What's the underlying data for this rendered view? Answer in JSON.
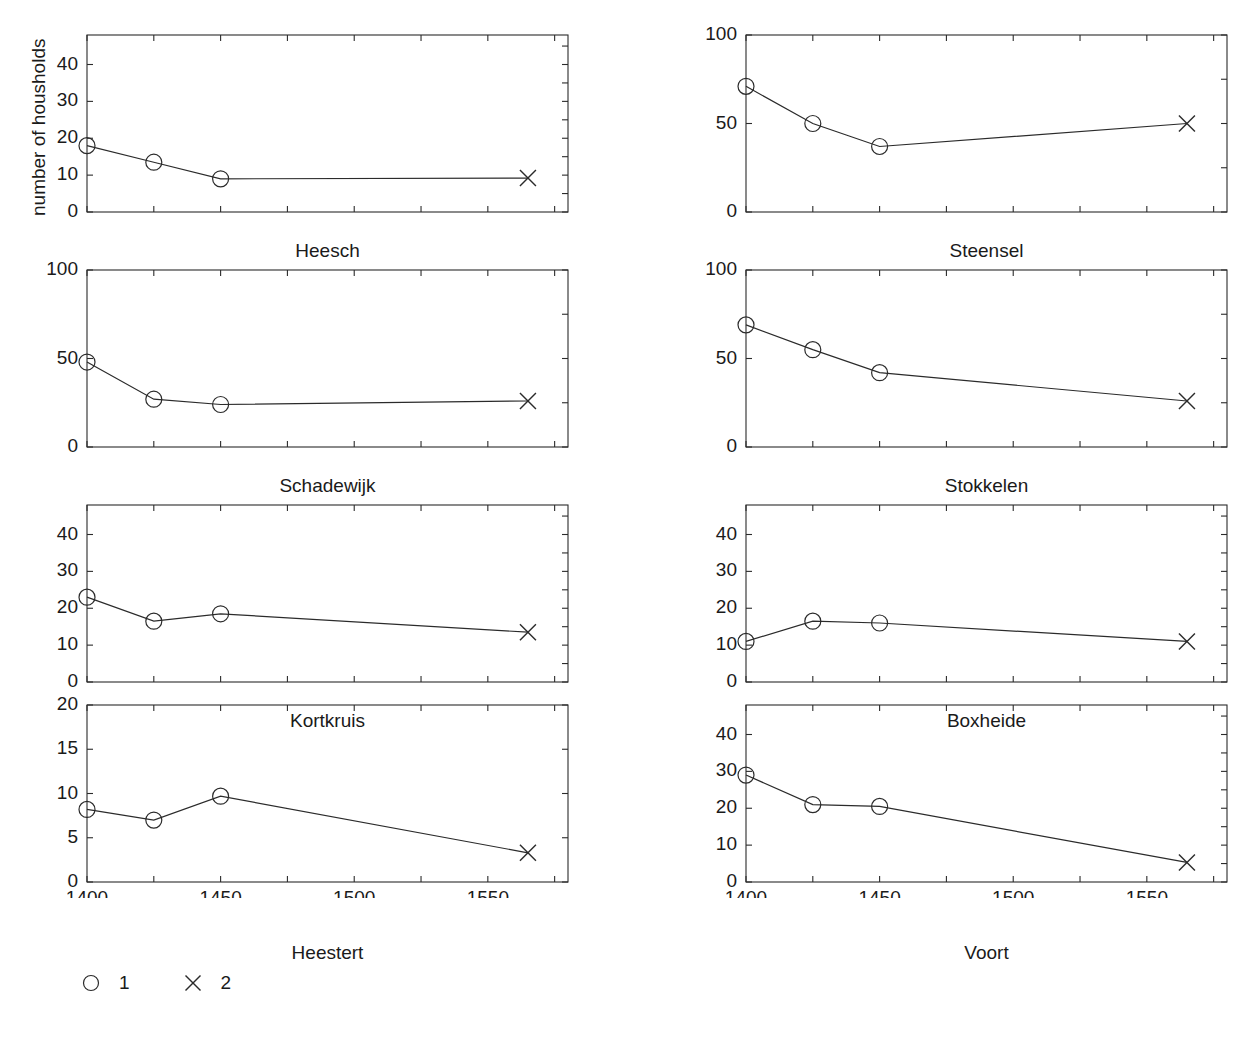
{
  "figure": {
    "ylabel": "number of housholds",
    "xtick_labels": [
      "1400",
      "1450",
      "1500",
      "1550"
    ],
    "xtick_values": [
      1400,
      1450,
      1500,
      1550
    ],
    "legend": [
      {
        "marker": "circle",
        "label": "1"
      },
      {
        "marker": "x",
        "label": "2"
      }
    ]
  },
  "chart_data": {
    "type": "line",
    "title": "",
    "xlabel": "",
    "ylabel": "number of housholds",
    "xlim": [
      1400,
      1580
    ],
    "x": [
      1400,
      1425,
      1450,
      1565
    ],
    "grid": false,
    "legend_position": "bottom-left",
    "legend_entries": [
      "1",
      "2"
    ],
    "marker_by_x": [
      "circle",
      "circle",
      "circle",
      "x"
    ],
    "panels": [
      {
        "name": "Heesch",
        "row": 0,
        "col": 0,
        "ylim": [
          0,
          48
        ],
        "yticks": [
          0,
          10,
          20,
          30,
          40
        ],
        "ytick_labels": [
          "0",
          "10",
          "20",
          "30",
          "40"
        ],
        "values": [
          18,
          13.5,
          9,
          9.2
        ]
      },
      {
        "name": "Steensel",
        "row": 0,
        "col": 1,
        "ylim": [
          0,
          100
        ],
        "yticks": [
          0,
          50,
          100
        ],
        "ytick_labels": [
          "0",
          "50",
          "100"
        ],
        "values": [
          71,
          50,
          37,
          50
        ]
      },
      {
        "name": "Schadewijk",
        "row": 1,
        "col": 0,
        "ylim": [
          0,
          100
        ],
        "yticks": [
          0,
          50,
          100
        ],
        "ytick_labels": [
          "0",
          "50",
          "100"
        ],
        "values": [
          48,
          27,
          24,
          26
        ]
      },
      {
        "name": "Stokkelen",
        "row": 1,
        "col": 1,
        "ylim": [
          0,
          100
        ],
        "yticks": [
          0,
          50,
          100
        ],
        "ytick_labels": [
          "0",
          "50",
          "100"
        ],
        "values": [
          69,
          55,
          42,
          26
        ]
      },
      {
        "name": "Kortkruis",
        "row": 2,
        "col": 0,
        "ylim": [
          0,
          48
        ],
        "yticks": [
          0,
          10,
          20,
          30,
          40
        ],
        "ytick_labels": [
          "0",
          "10",
          "20",
          "30",
          "40"
        ],
        "values": [
          23,
          16.5,
          18.5,
          13.5
        ]
      },
      {
        "name": "Boxheide",
        "row": 2,
        "col": 1,
        "ylim": [
          0,
          48
        ],
        "yticks": [
          0,
          10,
          20,
          30,
          40
        ],
        "ytick_labels": [
          "0",
          "10",
          "20",
          "30",
          "40"
        ],
        "values": [
          11,
          16.5,
          16,
          11
        ]
      },
      {
        "name": "Heestert",
        "row": 3,
        "col": 0,
        "ylim": [
          0,
          20
        ],
        "yticks": [
          0,
          5,
          10,
          15,
          20
        ],
        "ytick_labels": [
          "0",
          "5",
          "10",
          "15",
          "20"
        ],
        "values": [
          8.2,
          7,
          9.7,
          3.3
        ]
      },
      {
        "name": "Voort",
        "row": 3,
        "col": 1,
        "ylim": [
          0,
          48
        ],
        "yticks": [
          0,
          10,
          20,
          30,
          40
        ],
        "ytick_labels": [
          "0",
          "10",
          "20",
          "30",
          "40"
        ],
        "values": [
          29,
          21,
          20.5,
          5.3
        ]
      }
    ]
  }
}
